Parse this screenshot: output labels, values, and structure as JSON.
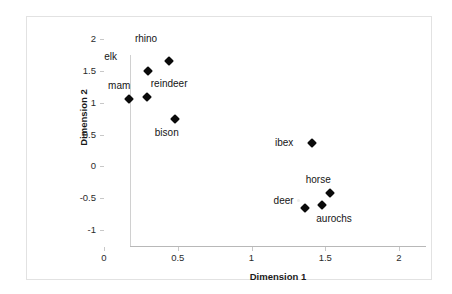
{
  "chart_data": {
    "type": "scatter",
    "title": "",
    "xlabel": "Dimension 1",
    "ylabel": "Dimension 2",
    "xlim": [
      0,
      2
    ],
    "ylim": [
      -1,
      2
    ],
    "xticks": [
      "0",
      "0.5",
      "1",
      "1.5",
      "2"
    ],
    "xtick_values": [
      0,
      0.5,
      1,
      1.5,
      2
    ],
    "yticks": [
      "2",
      "1.5",
      "1",
      "0.5",
      "0",
      "-0.5",
      "-1"
    ],
    "ytick_values": [
      2,
      1.5,
      1,
      0.5,
      0,
      -0.5,
      -1
    ],
    "grid": false,
    "legend": null,
    "marker": "diamond",
    "marker_color": "#0a0a0a",
    "points": [
      {
        "label": "rhino",
        "x": 0.44,
        "y": 1.66,
        "label_dx": -34,
        "label_dy": -22
      },
      {
        "label": "elk",
        "x": 0.3,
        "y": 1.5,
        "label_dx": -44,
        "label_dy": -14
      },
      {
        "label": "mam",
        "x": 0.17,
        "y": 1.06,
        "label_dx": -21,
        "label_dy": -13
      },
      {
        "label": "reindeer",
        "x": 0.29,
        "y": 1.09,
        "label_dx": 4,
        "label_dy": -13
      },
      {
        "label": "bison",
        "x": 0.48,
        "y": 0.74,
        "label_dx": -20,
        "label_dy": 14
      },
      {
        "label": "ibex",
        "x": 1.41,
        "y": 0.36,
        "label_dx": -37,
        "label_dy": 0
      },
      {
        "label": "horse",
        "x": 1.53,
        "y": -0.42,
        "label_dx": -24,
        "label_dy": -13
      },
      {
        "label": "deer",
        "x": 1.36,
        "y": -0.65,
        "label_dx": -31,
        "label_dy": -7
      },
      {
        "label": "aurochs",
        "x": 1.48,
        "y": -0.61,
        "label_dx": -6,
        "label_dy": 14
      }
    ]
  },
  "axes": {
    "x_title": "Dimension 1",
    "y_title": "Dimension 2"
  }
}
